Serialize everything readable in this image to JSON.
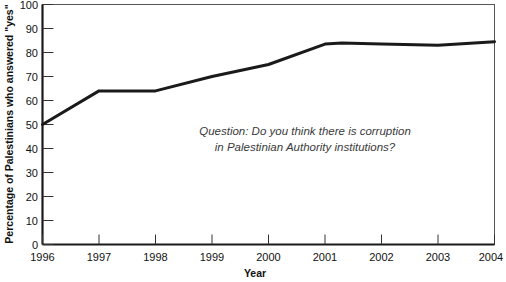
{
  "chart_data": {
    "type": "line",
    "title": "",
    "xlabel": "Year",
    "ylabel": "Percentage of Palestinians who answered \"yes\"",
    "xlim": [
      1996,
      2004
    ],
    "ylim": [
      0,
      100
    ],
    "grid": false,
    "legend": "none",
    "x_ticks": [
      "1996",
      "1997",
      "1998",
      "1999",
      "2000",
      "2001",
      "2002",
      "2003",
      "2004"
    ],
    "y_ticks": [
      "0",
      "10",
      "20",
      "30",
      "40",
      "50",
      "60",
      "70",
      "80",
      "90",
      "100"
    ],
    "annotations": [
      "Question: Do you think there is corruption",
      "in Palestinian Authority institutions?"
    ],
    "series": [
      {
        "name": "Percentage answering yes",
        "color": "#1a1a1a",
        "x": [
          1996,
          1997,
          1998,
          1999,
          2000,
          2001,
          2001.3,
          2002,
          2003,
          2004
        ],
        "values": [
          50,
          64,
          64,
          70,
          75,
          83.5,
          84,
          83.5,
          83,
          84.5
        ]
      }
    ]
  }
}
